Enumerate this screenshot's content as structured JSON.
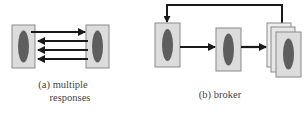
{
  "colors": {
    "box_fill": "#dcdcdc",
    "box_border": "#8a8a8a",
    "ellipse_fill": "#5e5e5e",
    "arrow": "#1a1a1a",
    "caption": "#444444"
  },
  "diagram_a": {
    "caption_line1": "(a) multiple",
    "caption_line2": "responses",
    "nodes": [
      {
        "id": "client",
        "label": ""
      },
      {
        "id": "server",
        "label": ""
      }
    ],
    "edges": [
      {
        "from": "client",
        "to": "server",
        "count": 1,
        "role": "request"
      },
      {
        "from": "server",
        "to": "client",
        "count": 3,
        "role": "responses"
      }
    ]
  },
  "diagram_b": {
    "caption": "(b) broker",
    "nodes": [
      {
        "id": "client",
        "label": ""
      },
      {
        "id": "broker",
        "label": ""
      },
      {
        "id": "servers",
        "label": "",
        "stacked": 3
      }
    ],
    "edges": [
      {
        "from": "client",
        "to": "broker"
      },
      {
        "from": "broker",
        "to": "servers"
      },
      {
        "from": "servers",
        "to": "client",
        "role": "feedback"
      }
    ]
  }
}
